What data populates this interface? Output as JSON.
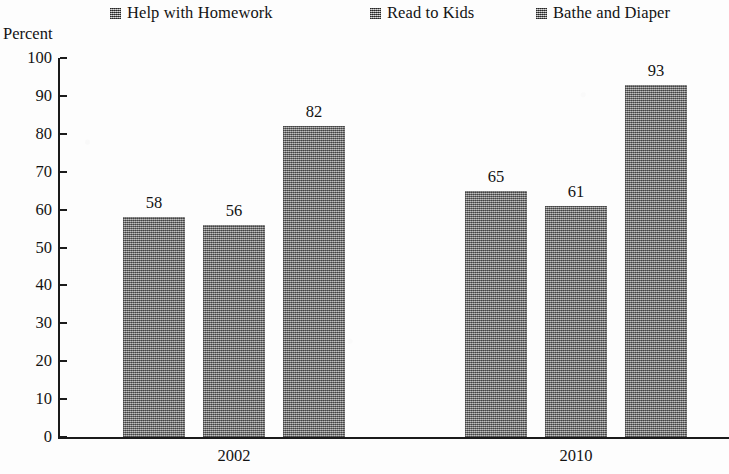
{
  "chart_data": {
    "type": "bar",
    "title": "",
    "xlabel": "",
    "ylabel": "Percent",
    "ylim": [
      0,
      100
    ],
    "ytick_step": 10,
    "yticks": [
      100,
      90,
      80,
      70,
      60,
      50,
      40,
      30,
      20,
      10,
      0
    ],
    "grid": false,
    "legend_position": "top",
    "categories": [
      "2002",
      "2010"
    ],
    "series": [
      {
        "name": "Help with Homework",
        "values": [
          58,
          65
        ]
      },
      {
        "name": "Read to Kids",
        "values": [
          56,
          61
        ]
      },
      {
        "name": "Bathe and Diaper",
        "values": [
          82,
          93
        ]
      }
    ],
    "bar_fill_color": "#8a8a8a",
    "axis_color": "#1b1b1b",
    "background_color": "#fdfdfd"
  },
  "legend": {
    "items": [
      {
        "label": "Help with Homework",
        "marker": "checkered-square-swatch"
      },
      {
        "label": "Read to Kids",
        "marker": "checkered-square-swatch"
      },
      {
        "label": "Bathe and Diaper",
        "marker": "checkered-square-swatch"
      }
    ]
  },
  "axes": {
    "y_title": "Percent",
    "y_labels": [
      "100",
      "90",
      "80",
      "70",
      "60",
      "50",
      "40",
      "30",
      "20",
      "10",
      "0"
    ],
    "x_labels": [
      "2002",
      "2010"
    ]
  },
  "bars": [
    {
      "value_label": "58",
      "series": "Help with Homework",
      "category": "2002"
    },
    {
      "value_label": "56",
      "series": "Read to Kids",
      "category": "2002"
    },
    {
      "value_label": "82",
      "series": "Bathe and Diaper",
      "category": "2002"
    },
    {
      "value_label": "65",
      "series": "Help with Homework",
      "category": "2010"
    },
    {
      "value_label": "61",
      "series": "Read to Kids",
      "category": "2010"
    },
    {
      "value_label": "93",
      "series": "Bathe and Diaper",
      "category": "2010"
    }
  ]
}
